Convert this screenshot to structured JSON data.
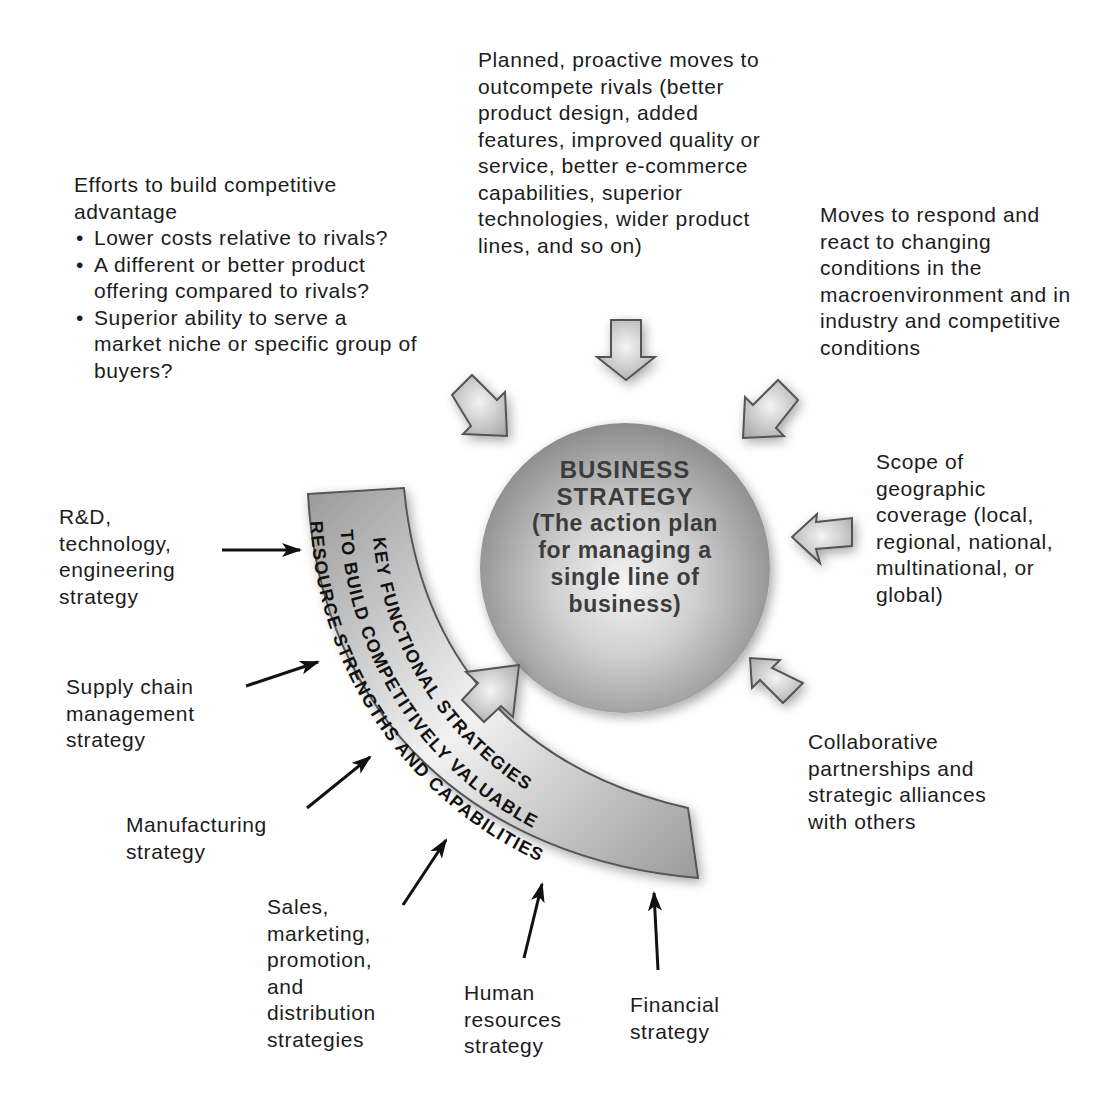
{
  "center": {
    "title_line1": "BUSINESS",
    "title_line2": "STRATEGY",
    "subtitle": "(The action plan for managing a single line of business)"
  },
  "band": {
    "line1": "KEY FUNCTIONAL STRATEGIES",
    "line2": "TO BUILD COMPETITIVELY VALUABLE",
    "line3": "RESOURCE STRENGTHS AND CAPABILITIES"
  },
  "inputs_top": {
    "competitive_advantage": {
      "heading": "Efforts to build competitive advantage",
      "bullets": [
        "Lower costs relative to rivals?",
        "A different or better product offering compared to rivals?",
        "Superior ability to serve a market niche or specific group of buyers?"
      ]
    },
    "proactive_moves": "Planned, proactive moves to outcompete rivals (better product design, added features, improved quality or service, better e-commerce capabilities, superior technologies, wider product lines, and so on)",
    "reactive_moves": "Moves to respond and react to changing conditions in the macroenvironment and in industry and competitive conditions",
    "geographic_scope": "Scope of geographic coverage (local, regional, national, multinational, or global)",
    "partnerships": "Collaborative partnerships and strategic alliances with others"
  },
  "functional_strategies": [
    "R&D, technology, engineering strategy",
    "Supply chain management strategy",
    "Manufacturing strategy",
    "Sales, marketing, promotion, and distribution strategies",
    "Human resources strategy",
    "Financial strategy"
  ],
  "colors": {
    "sphere_light": "#f2f2f2",
    "sphere_dark": "#8e8e8e",
    "arrow_fill": "#c8c8c8",
    "arrow_stroke": "#555555",
    "text": "#1c1c1c"
  }
}
